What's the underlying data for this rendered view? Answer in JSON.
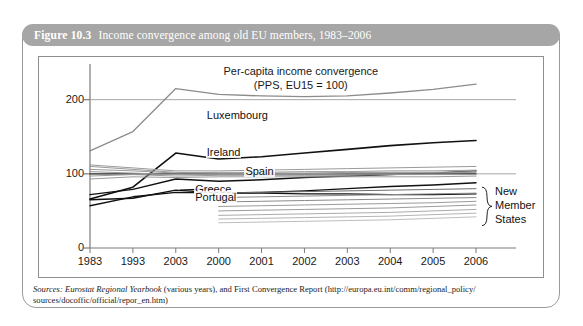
{
  "figure": {
    "number_label": "Figure 10.3",
    "caption": "Income convergence among old EU members, 1983–2006",
    "header_bg": "#a6a6a6",
    "header_text_color": "#ffffff",
    "frame_border_color": "#9a9a9a"
  },
  "source_note": {
    "line1_prefix": "Sources:",
    "line1_italic": "Eurostat Regional Yearbook",
    "line1_rest": "(various years), and First Convergence Report (http://europa.eu.int/comm/regional_policy/",
    "line2": "sources/docoffic/official/repor_en.htm)"
  },
  "chart_data": {
    "type": "line",
    "title": "Per-capita income convergence",
    "subtitle": "(PPS, EU15 = 100)",
    "title_line1": "Per-capita income convergence",
    "title_line2": "(PPS, EU15 = 100)",
    "xlabel": "",
    "ylabel": "",
    "ylim": [
      0,
      240
    ],
    "yticks": [
      0,
      100,
      200
    ],
    "ytick_labels": [
      "0",
      "100",
      "200"
    ],
    "grid": false,
    "legend": "none",
    "x": [
      "1983",
      "1993",
      "2003",
      "2000",
      "2001",
      "2002",
      "2003",
      "2004",
      "2005",
      "2006"
    ],
    "xtick_labels": [
      "1983",
      "1993",
      "2003",
      "2000",
      "2001",
      "2002",
      "2003",
      "2004",
      "2005",
      "2006"
    ],
    "annotations": [
      {
        "label": "Luxembourg",
        "x_frac": 0.3,
        "y_value": 178
      },
      {
        "label": "Ireland",
        "x_frac": 0.3,
        "y_value": 128
      },
      {
        "label": "Spain",
        "x_frac": 0.4,
        "y_value": 103
      },
      {
        "label": "Greece",
        "x_frac": 0.27,
        "y_value": 78
      },
      {
        "label": "Portugal",
        "x_frac": 0.27,
        "y_value": 68
      },
      {
        "label": "New Member States",
        "x_frac": 1.02,
        "y_value": 55
      }
    ],
    "bracket_label_lines": [
      "New",
      "Member",
      "States"
    ],
    "series": [
      {
        "name": "Luxembourg",
        "color": "#8c8c8c",
        "width": 1.3,
        "values": [
          131,
          157,
          215,
          207,
          205,
          204,
          205,
          209,
          214,
          221
        ]
      },
      {
        "name": "Ireland",
        "color": "#111111",
        "width": 1.6,
        "values": [
          66,
          82,
          128,
          120,
          123,
          128,
          133,
          138,
          142,
          145
        ]
      },
      {
        "name": "Spain",
        "color": "#111111",
        "width": 1.4,
        "values": [
          72,
          79,
          93,
          90,
          92,
          95,
          97,
          99,
          101,
          104
        ]
      },
      {
        "name": "Greece",
        "color": "#111111",
        "width": 1.4,
        "values": [
          65,
          67,
          78,
          74,
          75,
          77,
          80,
          83,
          85,
          88
        ]
      },
      {
        "name": "Portugal",
        "color": "#111111",
        "width": 1.4,
        "values": [
          57,
          69,
          75,
          74,
          74,
          73,
          73,
          72,
          72,
          73
        ]
      },
      {
        "name": "EU15 average",
        "color": "#333333",
        "width": 1.2,
        "values": [
          100,
          100,
          100,
          100,
          100,
          100,
          100,
          100,
          100,
          100
        ]
      },
      {
        "name": "old-member-band-1",
        "color": "#9a9a9a",
        "width": 1.0,
        "values": [
          112,
          108,
          104,
          104,
          105,
          106,
          107,
          108,
          109,
          110
        ]
      },
      {
        "name": "old-member-band-2",
        "color": "#9a9a9a",
        "width": 1.0,
        "values": [
          106,
          104,
          101,
          102,
          102,
          103,
          103,
          104,
          104,
          105
        ]
      },
      {
        "name": "old-member-band-3",
        "color": "#9a9a9a",
        "width": 1.0,
        "values": [
          103,
          101,
          99,
          100,
          100,
          100,
          101,
          101,
          101,
          102
        ]
      },
      {
        "name": "old-member-band-4",
        "color": "#9a9a9a",
        "width": 1.0,
        "values": [
          97,
          99,
          97,
          98,
          98,
          98,
          98,
          99,
          99,
          99
        ]
      },
      {
        "name": "old-member-band-5",
        "color": "#9a9a9a",
        "width": 1.0,
        "values": [
          93,
          96,
          95,
          96,
          96,
          96,
          96,
          96,
          96,
          97
        ]
      },
      {
        "name": "old-member-band-6",
        "color": "#9a9a9a",
        "width": 1.0,
        "values": [
          110,
          106,
          102,
          101,
          101,
          101,
          102,
          102,
          102,
          103
        ]
      },
      {
        "name": "nms-band-1",
        "color": "#6e6e6e",
        "width": 1.0,
        "start_index": 3,
        "values": [
          null,
          null,
          null,
          74,
          75,
          76,
          77,
          78,
          79,
          80
        ]
      },
      {
        "name": "nms-band-2",
        "color": "#8a8a8a",
        "width": 1.0,
        "start_index": 3,
        "values": [
          null,
          null,
          null,
          68,
          69,
          70,
          71,
          72,
          73,
          74
        ]
      },
      {
        "name": "nms-band-3",
        "color": "#8a8a8a",
        "width": 1.0,
        "start_index": 3,
        "values": [
          null,
          null,
          null,
          62,
          63,
          64,
          65,
          66,
          67,
          68
        ]
      },
      {
        "name": "nms-band-4",
        "color": "#9b9b9b",
        "width": 1.0,
        "start_index": 3,
        "values": [
          null,
          null,
          null,
          56,
          57,
          58,
          59,
          60,
          61,
          63
        ]
      },
      {
        "name": "nms-band-5",
        "color": "#9b9b9b",
        "width": 1.0,
        "start_index": 3,
        "values": [
          null,
          null,
          null,
          50,
          51,
          52,
          53,
          54,
          56,
          58
        ]
      },
      {
        "name": "nms-band-6",
        "color": "#ababab",
        "width": 1.0,
        "start_index": 3,
        "values": [
          null,
          null,
          null,
          44,
          45,
          46,
          47,
          48,
          50,
          52
        ]
      },
      {
        "name": "nms-band-7",
        "color": "#b5b5b5",
        "width": 1.0,
        "start_index": 3,
        "values": [
          null,
          null,
          null,
          39,
          40,
          41,
          42,
          43,
          45,
          47
        ]
      },
      {
        "name": "nms-band-8",
        "color": "#bdbdbd",
        "width": 1.0,
        "start_index": 3,
        "values": [
          null,
          null,
          null,
          34,
          35,
          36,
          37,
          38,
          40,
          42
        ]
      }
    ]
  }
}
